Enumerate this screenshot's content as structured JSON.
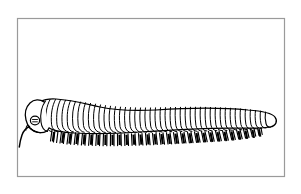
{
  "figure": {
    "kind": "line-drawing",
    "subject": "millipede",
    "subject_label": "Millipede",
    "orientation": "facing-left",
    "style": "black ink line art on white",
    "caption": "",
    "text_labels": [],
    "colors": {
      "background": "#ffffff",
      "ink": "#000000",
      "frame": "#9a9a9a",
      "page": "#ffffff"
    },
    "frame": {
      "x": 17,
      "y": 18,
      "width": 268,
      "height": 159,
      "stroke_width": 1.2
    },
    "canvas": {
      "width": 301,
      "height": 194
    }
  },
  "anatomy": {
    "head": {
      "label": "head-capsule",
      "center_x": 38,
      "center_y": 122,
      "radius_x": 13,
      "radius_y": 12
    },
    "eye": {
      "label": "eye-patch",
      "center_x": 35,
      "center_y": 121,
      "radius": 4.2
    },
    "antenna": {
      "label": "antenna",
      "start_x": 30,
      "start_y": 128,
      "end_x": 19,
      "end_y": 147
    },
    "collum": {
      "label": "collum-segment"
    },
    "body": {
      "label": "trunk",
      "segment_count": 42,
      "start_x": 44,
      "end_x": 277,
      "dorsal_peak_y": 103,
      "ventral_y": 134
    },
    "legs": {
      "label": "leg-row",
      "pair_count": 44,
      "row_top_y": 132,
      "row_bottom_y": 147
    },
    "telson": {
      "label": "telson-tail-tip",
      "x": 277,
      "y": 120
    }
  },
  "chart_data": {
    "type": "line",
    "title": "",
    "xlabel": "",
    "ylabel": "",
    "categories": [],
    "values": []
  }
}
